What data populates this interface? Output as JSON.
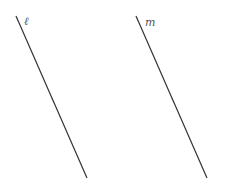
{
  "diagram": {
    "type": "parallel-lines",
    "line_color": "#333333",
    "label_color": "#555555",
    "lines": [
      {
        "id": "l",
        "label": "ℓ",
        "x1": 16,
        "y1": 16,
        "x2": 87,
        "y2": 178,
        "label_x": 24,
        "label_y": 25
      },
      {
        "id": "m",
        "label": "m",
        "x1": 136,
        "y1": 16,
        "x2": 207,
        "y2": 178,
        "label_x": 145,
        "label_y": 26
      }
    ]
  }
}
